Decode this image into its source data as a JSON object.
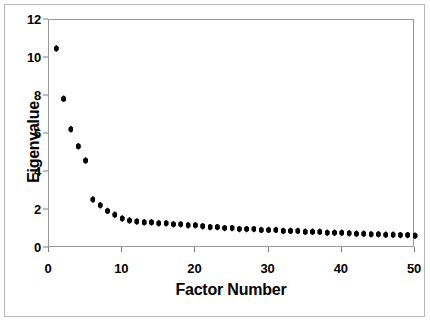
{
  "chart_data": {
    "type": "scatter",
    "title": "",
    "xlabel": "Factor Number",
    "ylabel": "Eigenvalue",
    "xlim": [
      0,
      50
    ],
    "ylim": [
      0,
      12
    ],
    "xticks": [
      0,
      10,
      20,
      30,
      40,
      50
    ],
    "yticks": [
      0,
      2,
      4,
      6,
      8,
      10,
      12
    ],
    "grid": false,
    "legend": null,
    "marker": "diamond",
    "marker_color": "#000000",
    "x": [
      1,
      2,
      3,
      4,
      5,
      6,
      7,
      8,
      9,
      10,
      11,
      12,
      13,
      14,
      15,
      16,
      17,
      18,
      19,
      20,
      21,
      22,
      23,
      24,
      25,
      26,
      27,
      28,
      29,
      30,
      31,
      32,
      33,
      34,
      35,
      36,
      37,
      38,
      39,
      40,
      41,
      42,
      43,
      44,
      45,
      46,
      47,
      48,
      49,
      50
    ],
    "values": [
      10.5,
      7.85,
      6.25,
      5.35,
      4.6,
      2.55,
      2.25,
      1.95,
      1.75,
      1.55,
      1.45,
      1.4,
      1.35,
      1.35,
      1.3,
      1.3,
      1.25,
      1.25,
      1.2,
      1.2,
      1.15,
      1.1,
      1.1,
      1.05,
      1.05,
      1.0,
      1.0,
      1.0,
      0.95,
      0.95,
      0.95,
      0.9,
      0.9,
      0.9,
      0.85,
      0.85,
      0.85,
      0.8,
      0.8,
      0.8,
      0.78,
      0.75,
      0.75,
      0.72,
      0.72,
      0.7,
      0.7,
      0.68,
      0.68,
      0.65
    ],
    "series_name": "Eigenvalue"
  },
  "figure": {
    "frame_color": "#b8b8b8",
    "axis_color": "#9a9a9a",
    "background": "#ffffff"
  }
}
